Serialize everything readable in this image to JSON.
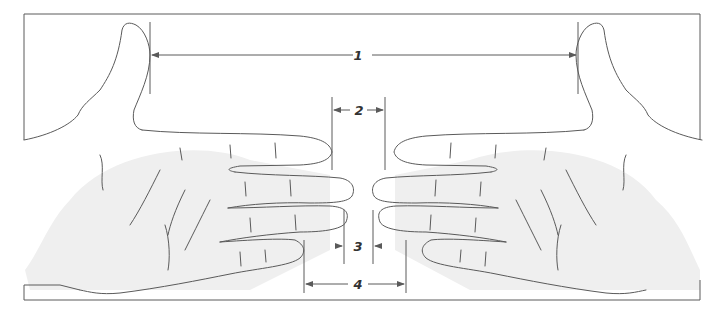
{
  "diagram": {
    "type": "hand-measurement-illustration",
    "line_color": "#5a5a5a",
    "shade_color": "#eeeeee",
    "measurements": [
      {
        "id": "1",
        "label": "1",
        "description": "distance between thumbs"
      },
      {
        "id": "2",
        "label": "2",
        "description": "distance between index fingertips"
      },
      {
        "id": "3",
        "label": "3",
        "description": "distance between ring fingertips"
      },
      {
        "id": "4",
        "label": "4",
        "description": "distance between little fingertips"
      }
    ]
  }
}
